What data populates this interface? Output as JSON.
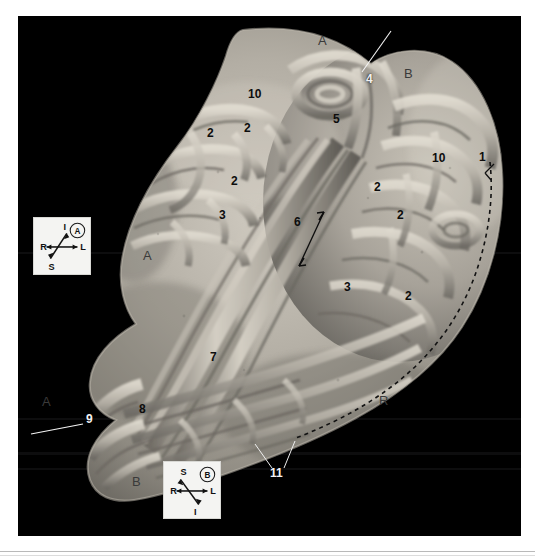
{
  "figure": {
    "kind": "anatomical-specimen-photograph",
    "background_color": "#000000",
    "page_background": "#ffffff",
    "plate": {
      "x": 18,
      "y": 16,
      "width": 503,
      "height": 520
    }
  },
  "labels": [
    {
      "id": "label-1",
      "text": "1",
      "x": 479,
      "y": 158,
      "tone": "dark"
    },
    {
      "id": "label-2a",
      "text": "2",
      "x": 207,
      "y": 133,
      "tone": "dark"
    },
    {
      "id": "label-2b",
      "text": "2",
      "x": 244,
      "y": 128,
      "tone": "dark"
    },
    {
      "id": "label-2c",
      "text": "2",
      "x": 231,
      "y": 181,
      "tone": "dark"
    },
    {
      "id": "label-2d",
      "text": "2",
      "x": 374,
      "y": 187,
      "tone": "dark"
    },
    {
      "id": "label-2e",
      "text": "2",
      "x": 397,
      "y": 215,
      "tone": "dark"
    },
    {
      "id": "label-2f",
      "text": "2",
      "x": 405,
      "y": 296,
      "tone": "dark"
    },
    {
      "id": "label-3a",
      "text": "3",
      "x": 219,
      "y": 215,
      "tone": "dark"
    },
    {
      "id": "label-3b",
      "text": "3",
      "x": 344,
      "y": 287,
      "tone": "dark"
    },
    {
      "id": "label-4",
      "text": "4",
      "x": 366,
      "y": 79,
      "tone": "light"
    },
    {
      "id": "label-5",
      "text": "5",
      "x": 333,
      "y": 119,
      "tone": "dark"
    },
    {
      "id": "label-6",
      "text": "6",
      "x": 294,
      "y": 222,
      "tone": "dark"
    },
    {
      "id": "label-7",
      "text": "7",
      "x": 210,
      "y": 357,
      "tone": "dark"
    },
    {
      "id": "label-8",
      "text": "8",
      "x": 139,
      "y": 409,
      "tone": "dark"
    },
    {
      "id": "label-9",
      "text": "9",
      "x": 86,
      "y": 419,
      "tone": "light"
    },
    {
      "id": "label-10a",
      "text": "10",
      "x": 252,
      "y": 94,
      "tone": "dark"
    },
    {
      "id": "label-10b",
      "text": "10",
      "x": 436,
      "y": 158,
      "tone": "dark"
    },
    {
      "id": "label-11",
      "text": "11",
      "x": 274,
      "y": 473,
      "tone": "light"
    }
  ],
  "watermarks": [
    {
      "id": "watermark-a-top",
      "text": "A",
      "x": 318,
      "y": 40
    },
    {
      "id": "watermark-b-topright",
      "text": "B",
      "x": 404,
      "y": 73
    },
    {
      "id": "watermark-a-midleft",
      "text": "A",
      "x": 143,
      "y": 255
    },
    {
      "id": "watermark-a-lowerleft",
      "text": "A",
      "x": 42,
      "y": 401
    },
    {
      "id": "watermark-r-lowerright",
      "text": "R",
      "x": 379,
      "y": 400
    },
    {
      "id": "watermark-b-bottom",
      "text": "B",
      "x": 132,
      "y": 481
    }
  ],
  "leader_lines": [
    {
      "id": "leader-to-4",
      "x1": 391,
      "y1": 31,
      "x2": 362,
      "y2": 72,
      "color": "#f4f4f4"
    },
    {
      "id": "leader-to-9",
      "x1": 31,
      "y1": 434,
      "x2": 83,
      "y2": 424,
      "color": "#f4f4f4"
    },
    {
      "id": "leader-11-left",
      "x1": 272,
      "y1": 468,
      "x2": 255,
      "y2": 444,
      "color": "#efefef"
    },
    {
      "id": "leader-11-right",
      "x1": 284,
      "y1": 468,
      "x2": 295,
      "y2": 441,
      "color": "#efefef"
    }
  ],
  "annotation_arrow": {
    "id": "double-arrow-6",
    "label_ref": "label-6",
    "x1": 304,
    "y1": 196,
    "x2": 279,
    "y2": 250,
    "heads": "both",
    "color": "#0d0d0d"
  },
  "dashed_boundary": {
    "id": "dashed-margin-line",
    "description": "dashed curve tracing the greater-curvature cut margin",
    "color": "#121212",
    "dash": "4 4"
  },
  "compass_a": {
    "id": "compass-a",
    "box_letter": "A",
    "x": 33,
    "y": 217,
    "size": 58,
    "axes": {
      "left": "R",
      "right": "L",
      "diagonal_upper_left": "I",
      "diagonal_lower_right": "S"
    }
  },
  "compass_b": {
    "id": "compass-b",
    "box_letter": "B",
    "x": 163,
    "y": 461,
    "size": 58,
    "axes": {
      "left": "R",
      "right": "L",
      "diagonal_upper_left": "S",
      "diagonal_lower_right": "I"
    }
  }
}
